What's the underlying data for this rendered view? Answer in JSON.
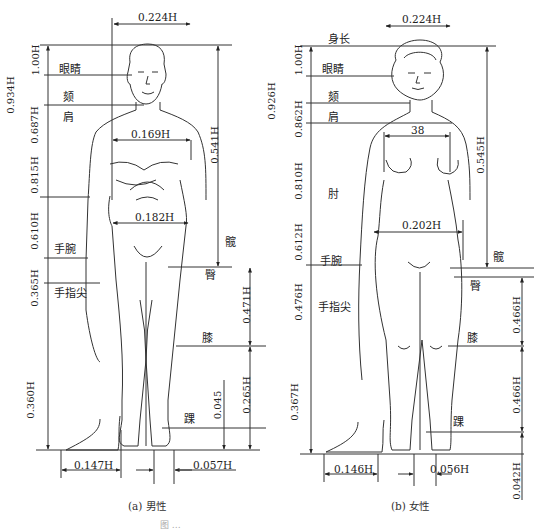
{
  "figure": {
    "caption_truncated": "图 …",
    "panels": [
      {
        "id": "male",
        "caption": "(a) 男性",
        "height_ratios_left": [
          {
            "value": "1.00H",
            "level": "头顶 (top)"
          },
          {
            "value": "0.934H",
            "level": "眼睛 (eyes)"
          },
          {
            "value": "0.687H",
            "level": "肩 (shoulder)"
          },
          {
            "value": "0.815H",
            "level": "肩"
          },
          {
            "value": "0.610H",
            "level": "手腕"
          },
          {
            "value": "0.365H",
            "level": "手指尖"
          },
          {
            "value": "0.360H",
            "level": "floor"
          }
        ],
        "landmarks": [
          "眼睛",
          "颏",
          "肩",
          "手腕",
          "手指尖",
          "髋",
          "臀",
          "膝",
          "踝"
        ],
        "widths": [
          {
            "label": "0.224H",
            "what": "head-top"
          },
          {
            "label": "0.169H",
            "what": "chest"
          },
          {
            "label": "0.182H",
            "what": "hip"
          },
          {
            "label": "0.147H",
            "what": "foot length"
          },
          {
            "label": "0.057H",
            "what": "foot width"
          }
        ],
        "right_heights": [
          {
            "label": "0.541H",
            "what": "top → 髋"
          },
          {
            "label": "0.471H",
            "what": "臀 → 膝"
          },
          {
            "label": "0.265H",
            "what": "膝 → floor"
          },
          {
            "label": "0.045",
            "what": "踝 → floor"
          }
        ]
      },
      {
        "id": "female",
        "caption": "(b) 女性",
        "height_ratios_left": [
          {
            "value": "1.00H",
            "level": "身长"
          },
          {
            "value": "0.926H",
            "level": "眼睛"
          },
          {
            "value": "0.862H",
            "level": "肩"
          },
          {
            "value": "0.810H",
            "level": "肘"
          },
          {
            "value": "0.612H",
            "level": "手腕"
          },
          {
            "value": "0.476H",
            "level": "手指尖"
          },
          {
            "value": "0.367H",
            "level": "floor"
          }
        ],
        "landmarks": [
          "身长",
          "眼睛",
          "颏",
          "肩",
          "肘",
          "手腕",
          "手指尖",
          "髋",
          "臀",
          "膝",
          "踝"
        ],
        "widths": [
          {
            "label": "0.224H",
            "what": "head-top"
          },
          {
            "label": "38",
            "what": "chest"
          },
          {
            "label": "0.202H",
            "what": "hip"
          },
          {
            "label": "0.146H",
            "what": "foot length"
          },
          {
            "label": "0.056H",
            "what": "foot width"
          }
        ],
        "right_heights": [
          {
            "label": "0.545H",
            "what": "top → 髋"
          },
          {
            "label": "0.466H",
            "what": "臀 → 膝"
          },
          {
            "label": "0.466H",
            "what": "膝 → 踝"
          },
          {
            "label": "0.042H",
            "what": "floor offset"
          }
        ]
      }
    ]
  },
  "male": {
    "w_head": "0.224H",
    "w_chest": "0.169H",
    "w_hip": "0.182H",
    "w_foot": "0.147H",
    "w_footw": "0.057H",
    "v_100": "1.00H",
    "v_934": "0.934H",
    "v_687": "0.687H",
    "v_815": "0.815H",
    "v_610": "0.610H",
    "v_365": "0.365H",
    "v_360": "0.360H",
    "r_541": "0.541H",
    "r_471": "0.471H",
    "r_265": "0.265H",
    "r_045": "0.045",
    "l_eye": "眼睛",
    "l_chin": "颏",
    "l_shoulder": "肩",
    "l_wrist": "手腕",
    "l_finger": "手指尖",
    "l_hip": "髋",
    "l_butt": "臀",
    "l_knee": "膝",
    "l_ankle": "踝",
    "caption": "(a) 男性"
  },
  "female": {
    "w_head": "0.224H",
    "w_chest": "38",
    "w_hip": "0.202H",
    "w_foot": "0.146H",
    "w_footw": "0.056H",
    "v_100": "1.00H",
    "v_926": "0.926H",
    "v_862": "0.862H",
    "v_810": "0.810H",
    "v_612": "0.612H",
    "v_476": "0.476H",
    "v_367": "0.367H",
    "r_545": "0.545H",
    "r_466a": "0.466H",
    "r_466b": "0.466H",
    "r_042": "0.042H",
    "l_height": "身长",
    "l_eye": "眼睛",
    "l_chin": "颏",
    "l_shoulder": "肩",
    "l_elbow": "肘",
    "l_wrist": "手腕",
    "l_finger": "手指尖",
    "l_hip": "髋",
    "l_butt": "臀",
    "l_knee": "膝",
    "l_ankle": "踝",
    "caption": "(b) 女性"
  },
  "footer": {
    "caption_truncated": "图 …"
  }
}
